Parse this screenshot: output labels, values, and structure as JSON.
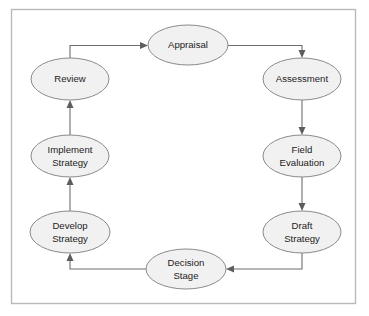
{
  "diagram": {
    "type": "cycle-flowchart",
    "title": "",
    "frame": {
      "border_color": "#b9b9b9",
      "background": "#ffffff"
    },
    "style": {
      "node_fill": "#f2f1f1",
      "node_stroke": "#8a8a8a",
      "connector_color": "#6e6e6e",
      "text_color": "#1c1c1c"
    },
    "nodes": [
      {
        "id": "appraisal",
        "label": "Appraisal",
        "lines": [
          "Appraisal"
        ],
        "cx": 188,
        "cy": 45,
        "rx": 40,
        "ry": 20
      },
      {
        "id": "assessment",
        "label": "Assessment",
        "lines": [
          "Assessment"
        ],
        "cx": 302,
        "cy": 79,
        "rx": 39,
        "ry": 21
      },
      {
        "id": "field-evaluation",
        "label": "Field Evaluation",
        "lines": [
          "Field",
          "Evaluation"
        ],
        "cx": 302,
        "cy": 156,
        "rx": 39,
        "ry": 21
      },
      {
        "id": "draft-strategy",
        "label": "Draft Strategy",
        "lines": [
          "Draft",
          "Strategy"
        ],
        "cx": 302,
        "cy": 232,
        "rx": 39,
        "ry": 21
      },
      {
        "id": "decision-stage",
        "label": "Decision Stage",
        "lines": [
          "Decision",
          "Stage"
        ],
        "cx": 186,
        "cy": 269,
        "rx": 40,
        "ry": 20
      },
      {
        "id": "develop-strategy",
        "label": "Develop Strategy",
        "lines": [
          "Develop",
          "Strategy"
        ],
        "cx": 70,
        "cy": 232,
        "rx": 40,
        "ry": 21
      },
      {
        "id": "implement-strategy",
        "label": "Implement Strategy",
        "lines": [
          "Implement",
          "Strategy"
        ],
        "cx": 70,
        "cy": 156,
        "rx": 39,
        "ry": 21
      },
      {
        "id": "review",
        "label": "Review",
        "lines": [
          "Review"
        ],
        "cx": 70,
        "cy": 79,
        "rx": 39,
        "ry": 21
      }
    ],
    "edges": [
      {
        "id": "review-to-appraisal",
        "from": "review",
        "to": "appraisal"
      },
      {
        "id": "appraisal-to-assessment",
        "from": "appraisal",
        "to": "assessment"
      },
      {
        "id": "assessment-to-field-evaluation",
        "from": "assessment",
        "to": "field-evaluation"
      },
      {
        "id": "field-evaluation-to-draft-strategy",
        "from": "field-evaluation",
        "to": "draft-strategy"
      },
      {
        "id": "draft-strategy-to-decision-stage",
        "from": "draft-strategy",
        "to": "decision-stage"
      },
      {
        "id": "decision-stage-to-develop-strategy",
        "from": "decision-stage",
        "to": "develop-strategy"
      },
      {
        "id": "develop-strategy-to-implement-strategy",
        "from": "develop-strategy",
        "to": "implement-strategy"
      },
      {
        "id": "implement-strategy-to-review",
        "from": "implement-strategy",
        "to": "review"
      }
    ]
  }
}
